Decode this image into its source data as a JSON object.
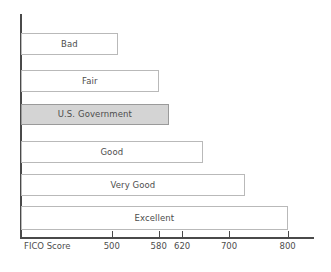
{
  "chart_data": {
    "type": "bar",
    "orientation": "horizontal",
    "title": "",
    "subtitle": "",
    "xlabel": "FICO Score",
    "ylabel": "",
    "categories": [
      "Bad",
      "Fair",
      "U.S. Government",
      "Good",
      "Very Good",
      "Excellent"
    ],
    "values": [
      510,
      580,
      597,
      655,
      727,
      800
    ],
    "xlim": [
      345,
      845
    ],
    "xticks": [
      500,
      580,
      620,
      700,
      800
    ],
    "xticklabels": [
      "500",
      "580",
      "620",
      "700",
      "800"
    ],
    "grid": false,
    "legend": false,
    "highlighted_category": "U.S. Government",
    "bar_labels_inside": true,
    "colors": {
      "bar_fill": "#ffffff",
      "bar_stroke": "#b9b9b9",
      "highlight_fill": "#d4d4d4",
      "highlight_stroke": "#9a9a9a",
      "axis": "#4a4a4a",
      "text": "#4d4d4d",
      "background": "#ffffff"
    }
  },
  "axis": {
    "x_title": "FICO Score",
    "ticks": [
      {
        "label": "500",
        "value": 500
      },
      {
        "label": "580",
        "value": 580
      },
      {
        "label": "620",
        "value": 620
      },
      {
        "label": "700",
        "value": 700
      },
      {
        "label": "800",
        "value": 800
      }
    ]
  },
  "bars": [
    {
      "label": "Bad",
      "value": 510,
      "highlighted": false
    },
    {
      "label": "Fair",
      "value": 580,
      "highlighted": false
    },
    {
      "label": "U.S. Government",
      "value": 597,
      "highlighted": true
    },
    {
      "label": "Good",
      "value": 655,
      "highlighted": false
    },
    {
      "label": "Very Good",
      "value": 727,
      "highlighted": false
    },
    {
      "label": "Excellent",
      "value": 800,
      "highlighted": false
    }
  ]
}
